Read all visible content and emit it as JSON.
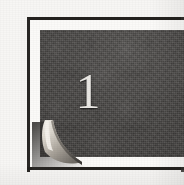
{
  "page": {
    "kind": "scanned-book-chapter-opener",
    "width": 184,
    "height": 185,
    "background_color": "#f7f6f4"
  },
  "chapter_opener": {
    "number": "1",
    "number_color": "#e9e7e3",
    "plate_color": "#4b4947",
    "plate_color_dark": "#403e3c",
    "plate_color_light": "#565452",
    "frame_color": "#24221f",
    "mat_color": "#fbfaf8"
  },
  "page_curl": {
    "name": "page-curl-corner",
    "position": "bottom-left",
    "highlight_color": "#efece6",
    "midtone_color": "#b9b4ac",
    "shadow_color": "#46433f",
    "underside_color": "#d8d3ca"
  },
  "icons": {
    "page_curl_icon": "page-curl-icon",
    "chapter_plate_icon": "dark-plate-icon"
  }
}
